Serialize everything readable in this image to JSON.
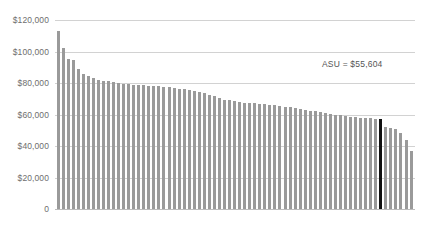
{
  "chart_data": {
    "type": "bar",
    "title": "",
    "subtitle": "",
    "xlabel": "",
    "ylabel": "",
    "ylim": [
      0,
      120000
    ],
    "grid": true,
    "legend": null,
    "tick_labels": [
      "$120,000",
      "$100,000",
      "$80,000",
      "$60,000",
      "$40,000",
      "$20,000",
      "0"
    ],
    "tick_values": [
      120000,
      100000,
      80000,
      60000,
      40000,
      20000,
      0
    ],
    "annotations": [
      {
        "name": "average-label",
        "text": "ASU = $55,604",
        "value": 55604
      }
    ],
    "highlight": {
      "index": 64,
      "color": "#111111",
      "value": 57000,
      "label": "ASU = $55,604"
    },
    "bar_color": "#9a9a9a",
    "categories": [
      "1",
      "2",
      "3",
      "4",
      "5",
      "6",
      "7",
      "8",
      "9",
      "10",
      "11",
      "12",
      "13",
      "14",
      "15",
      "16",
      "17",
      "18",
      "19",
      "20",
      "21",
      "22",
      "23",
      "24",
      "25",
      "26",
      "27",
      "28",
      "29",
      "30",
      "31",
      "32",
      "33",
      "34",
      "35",
      "36",
      "37",
      "38",
      "39",
      "40",
      "41",
      "42",
      "43",
      "44",
      "45",
      "46",
      "47",
      "48",
      "49",
      "50",
      "51",
      "52",
      "53",
      "54",
      "55",
      "56",
      "57",
      "58",
      "59",
      "60",
      "61",
      "62",
      "63",
      "64",
      "65",
      "66",
      "67",
      "68",
      "69",
      "70",
      "71"
    ],
    "values": [
      113000,
      102000,
      95000,
      94500,
      89000,
      86000,
      84500,
      83000,
      82000,
      81500,
      81000,
      80500,
      80000,
      79500,
      79200,
      79000,
      78800,
      78500,
      78200,
      78000,
      77800,
      77500,
      77200,
      77000,
      76500,
      76000,
      75500,
      75000,
      74500,
      73500,
      72500,
      71500,
      70500,
      69500,
      69000,
      68500,
      68000,
      67500,
      67200,
      67000,
      66800,
      66500,
      66200,
      66000,
      65500,
      65000,
      64500,
      64000,
      63500,
      63000,
      62500,
      62000,
      61500,
      61000,
      60500,
      60000,
      59500,
      59000,
      58500,
      58200,
      58000,
      57800,
      57500,
      57200,
      57000,
      52000,
      51500,
      51000,
      48000,
      44000,
      37000
    ]
  },
  "yaxis": {
    "ticks": [
      {
        "label": "$120,000",
        "value": 120000
      },
      {
        "label": "$100,000",
        "value": 100000
      },
      {
        "label": "$80,000",
        "value": 80000
      },
      {
        "label": "$60,000",
        "value": 60000
      },
      {
        "label": "$40,000",
        "value": 40000
      },
      {
        "label": "$20,000",
        "value": 20000
      },
      {
        "label": "0",
        "value": 0
      }
    ]
  },
  "annotation": {
    "asu_label": "ASU = $55,604"
  },
  "caption": {
    "text": ""
  },
  "colors": {
    "bar": "#9a9a9a",
    "highlight": "#111111",
    "gridline": "#d2d2d2",
    "text": "#6e6e6e"
  }
}
